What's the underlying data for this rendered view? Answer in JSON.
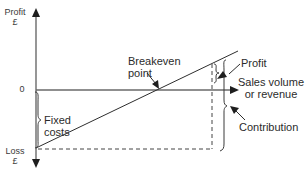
{
  "diagram": {
    "type": "breakeven-chart",
    "y_axis": {
      "top_label_line1": "Profit",
      "top_label_line2": "£",
      "zero_label": "0",
      "bottom_label_line1": "Loss",
      "bottom_label_line2": "£"
    },
    "x_axis": {
      "label_line1": "Sales volume",
      "label_line2": "or revenue"
    },
    "annotations": {
      "breakeven_line1": "Breakeven",
      "breakeven_line2": "point",
      "profit": "Profit",
      "fixed_costs_line1": "Fixed",
      "fixed_costs_line2": "costs",
      "contribution": "Contribution"
    },
    "colors": {
      "axis": "#6a6a6a",
      "line": "#2e2e2e",
      "text": "#2b2b2b"
    }
  }
}
